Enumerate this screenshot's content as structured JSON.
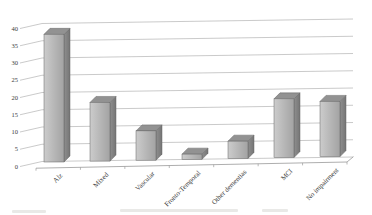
{
  "window": {
    "background": "#ffffff"
  },
  "chart_data": {
    "type": "bar",
    "variant": "3d-column",
    "title": "",
    "xlabel": "",
    "ylabel": "",
    "categories": [
      "Alz",
      "Mixed",
      "Vascular",
      "Fronto-Temporal",
      "Other dementias",
      "MCI",
      "No impairment"
    ],
    "values": [
      37,
      17,
      8.5,
      1.5,
      5,
      17,
      16
    ],
    "ylim": [
      0,
      40
    ],
    "yticks": [
      0,
      5,
      10,
      15,
      20,
      25,
      30,
      35,
      40
    ],
    "grid": true,
    "legend_position": "none",
    "category_label_rotation_deg": -45,
    "colors": {
      "bar_front": "#b5b5b5",
      "bar_front_light": "#cccccc",
      "bar_front_dark": "#a3a3a3",
      "bar_top": "#929292",
      "bar_side": "#757575",
      "bar_side_light": "#8f8f8f",
      "bar_outline": "#666666",
      "gridline": "#b3b3b3",
      "axis_line": "#999999",
      "tick_label": "#3a3a3a",
      "background": "#ffffff"
    }
  }
}
